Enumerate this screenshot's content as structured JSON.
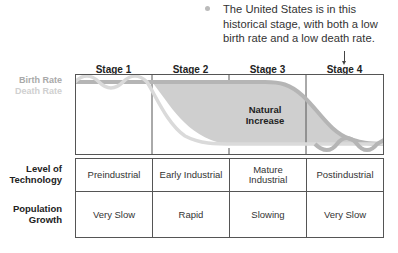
{
  "annotation": {
    "text": "The United States is in this historical stage, with both a low birth rate and a low death rate.",
    "points_to": "Stage 4"
  },
  "legend": {
    "birth_rate": "Birth Rate",
    "death_rate": "Death Rate",
    "birth_color": "#a9a9a9",
    "death_color": "#d0d0d0"
  },
  "stages": [
    {
      "label": "Stage 1",
      "technology": "Preindustrial",
      "growth": "Very Slow"
    },
    {
      "label": "Stage 2",
      "technology": "Early Industrial",
      "growth": "Rapid"
    },
    {
      "label": "Stage 3",
      "technology": "Mature Industrial",
      "growth": "Slowing"
    },
    {
      "label": "Stage 4",
      "technology": "Postindustrial",
      "growth": "Very Slow"
    }
  ],
  "chart": {
    "shaded_area_label_line1": "Natural",
    "shaded_area_label_line2": "Increase",
    "shade_color": "#cfcfcf"
  },
  "rows": {
    "technology_label_line1": "Level of",
    "technology_label_line2": "Technology",
    "growth_label_line1": "Population",
    "growth_label_line2": "Growth"
  }
}
